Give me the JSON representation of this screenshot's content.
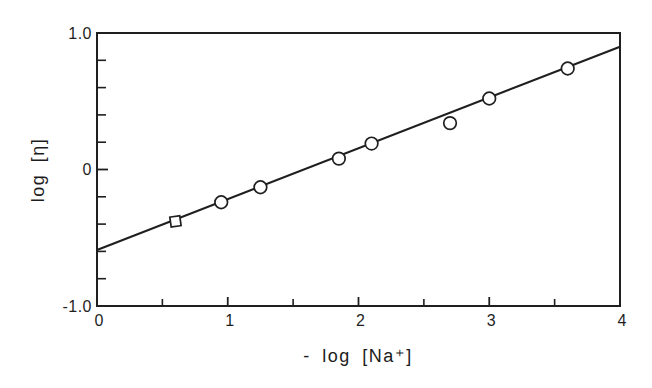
{
  "figure": {
    "background": "#ffffff",
    "ink_color": "#1f1f1f"
  },
  "chart_data": {
    "type": "scatter",
    "title": "",
    "xlabel": "- log [Na⁺]",
    "ylabel": "log [η]",
    "xlim": [
      0,
      4
    ],
    "ylim": [
      -1.0,
      1.0
    ],
    "grid": "off",
    "legend": "none",
    "x_ticks": {
      "major": [
        1,
        2,
        3
      ],
      "minor": [
        0.5,
        1.5,
        2.5,
        3.5
      ],
      "labels": [
        {
          "value": 0,
          "text": "0"
        },
        {
          "value": 1,
          "text": "1"
        },
        {
          "value": 2,
          "text": "2"
        },
        {
          "value": 3,
          "text": "3"
        },
        {
          "value": 4,
          "text": "4"
        }
      ]
    },
    "y_ticks": {
      "major": [
        0
      ],
      "minor": [
        -0.8,
        -0.6,
        -0.4,
        -0.2,
        0.2,
        0.4,
        0.6,
        0.8
      ],
      "labels": [
        {
          "value": 1.0,
          "text": "1.0"
        },
        {
          "value": 0,
          "text": "0"
        },
        {
          "value": -1.0,
          "text": "-1.0"
        }
      ]
    },
    "points": [
      {
        "x": 0.6,
        "y": -0.38,
        "marker": "square"
      },
      {
        "x": 0.95,
        "y": -0.24,
        "marker": "circle"
      },
      {
        "x": 1.25,
        "y": -0.13,
        "marker": "circle"
      },
      {
        "x": 1.85,
        "y": 0.08,
        "marker": "circle"
      },
      {
        "x": 2.1,
        "y": 0.19,
        "marker": "circle"
      },
      {
        "x": 2.7,
        "y": 0.34,
        "marker": "circle"
      },
      {
        "x": 3.0,
        "y": 0.52,
        "marker": "circle"
      },
      {
        "x": 3.6,
        "y": 0.74,
        "marker": "circle"
      }
    ],
    "fit_line": {
      "x_start": 0,
      "y_start": -0.59,
      "x_end": 4,
      "y_end": 0.9
    }
  }
}
